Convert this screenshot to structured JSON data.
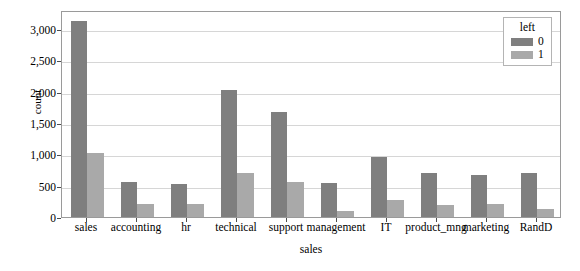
{
  "chart_data": {
    "type": "bar",
    "title": "",
    "xlabel": "sales",
    "ylabel": "count",
    "categories": [
      "sales",
      "accounting",
      "hr",
      "technical",
      "support",
      "management",
      "IT",
      "product_mng",
      "marketing",
      "RandD"
    ],
    "series": [
      {
        "name": "0",
        "color": "#7f7f7f",
        "values": [
          3126,
          563,
          524,
          2023,
          1674,
          539,
          954,
          704,
          673,
          697
        ]
      },
      {
        "name": "1",
        "color": "#a9a9a9",
        "values": [
          1014,
          204,
          215,
          697,
          555,
          91,
          273,
          198,
          203,
          121
        ]
      }
    ],
    "ylim": [
      0,
      3300
    ],
    "yticks": [
      0,
      500,
      1000,
      1500,
      2000,
      2500,
      3000
    ],
    "ytick_labels": [
      "0",
      "500",
      "1,000",
      "1,500",
      "2,000",
      "2,500",
      "3,000"
    ],
    "grid": true,
    "grid_axis": "y",
    "legend": {
      "title": "left",
      "position": "upper right",
      "entries": [
        {
          "label": "0",
          "color": "#7f7f7f"
        },
        {
          "label": "1",
          "color": "#a9a9a9"
        }
      ]
    },
    "colors": {
      "series_0": "#7f7f7f",
      "series_1": "#a9a9a9",
      "gridline": "#d6d6d6",
      "frame": "#9a9a9a",
      "background": "#ffffff",
      "text": "#000000"
    }
  }
}
